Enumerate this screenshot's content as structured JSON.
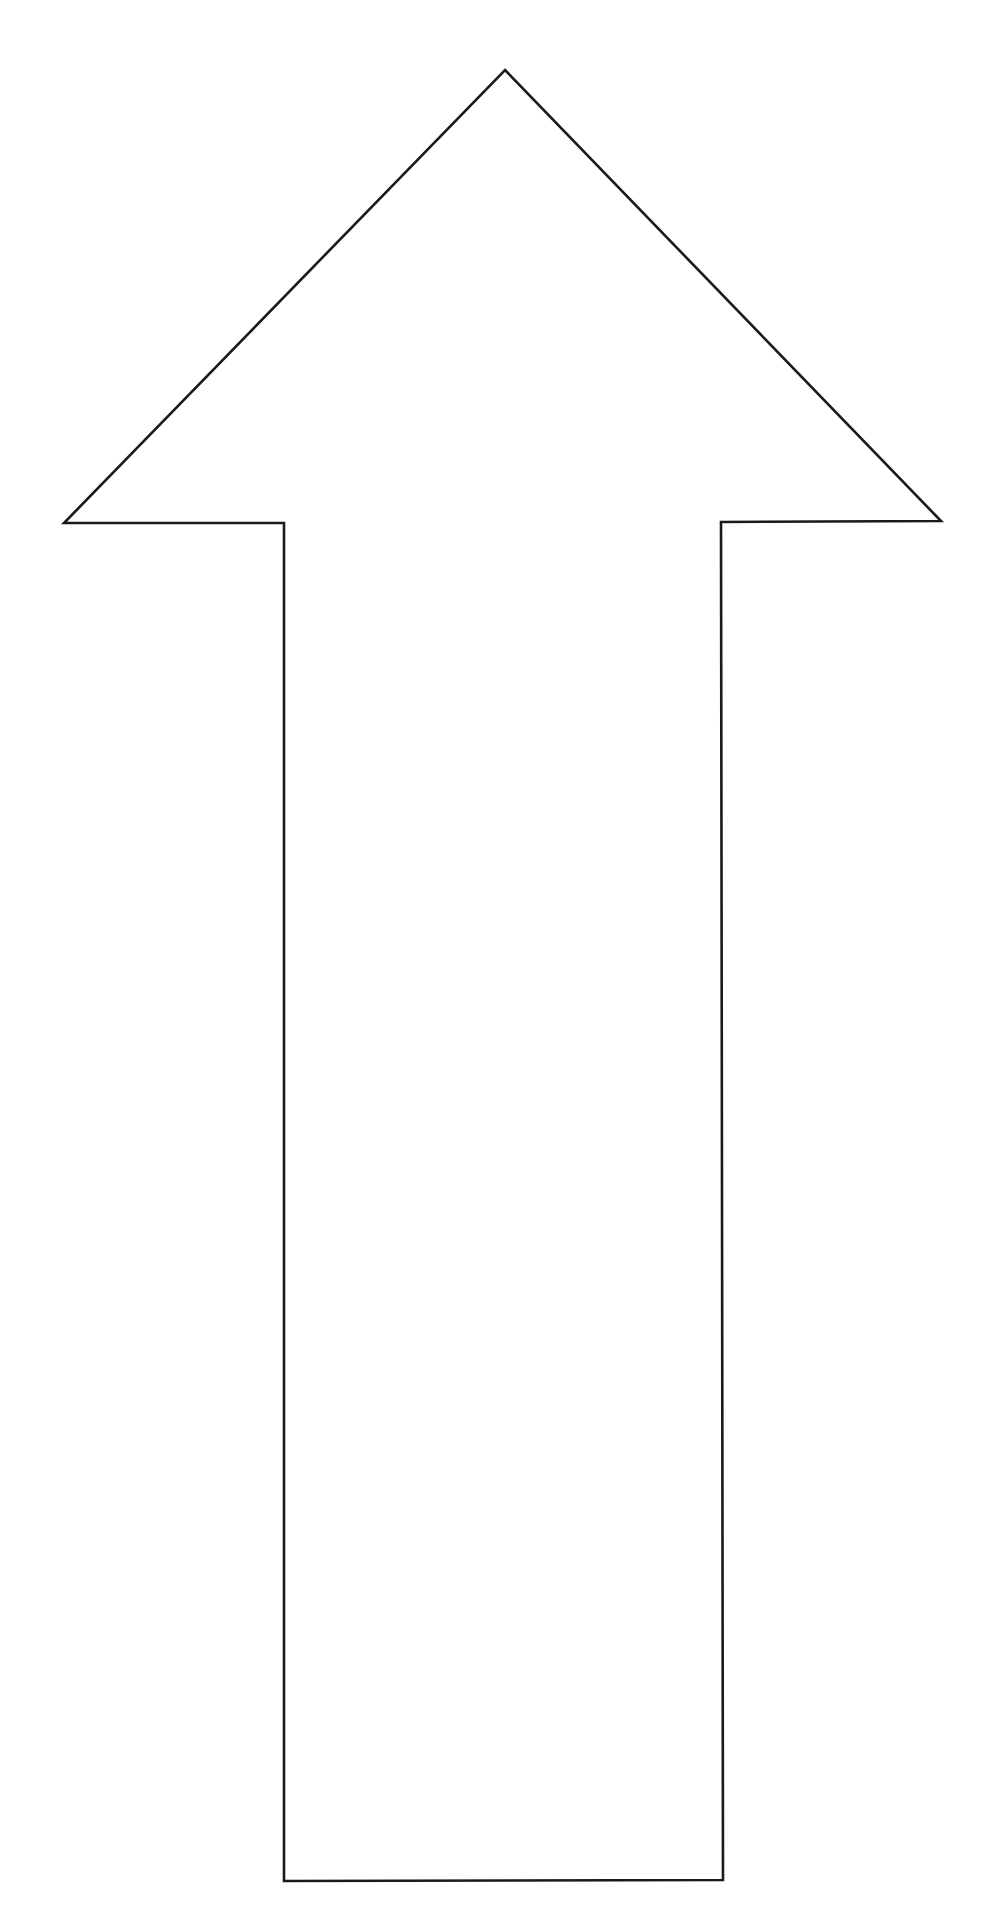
{
  "diagram": {
    "type": "arrow",
    "direction": "up",
    "style": {
      "background": "#ffffff",
      "stroke": "#1a1a1a",
      "fill": "#ffffff",
      "stroke_width": 2.6
    },
    "shape_points": [
      [
        505,
        70
      ],
      [
        941,
        521
      ],
      [
        721,
        522
      ],
      [
        723,
        1880
      ],
      [
        284,
        1881
      ],
      [
        284,
        523
      ],
      [
        64,
        523
      ]
    ]
  }
}
